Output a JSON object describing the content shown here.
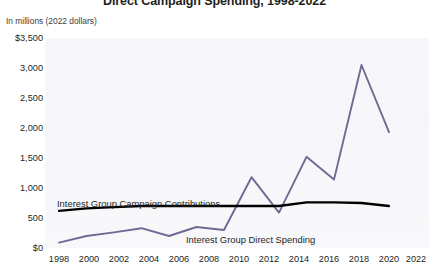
{
  "chart": {
    "title": "Direct Campaign Spending, 1998-2022",
    "axis_units_note": "In millions (2022 dollars)"
  },
  "series_labels": {
    "contributions": "Interest Group Campaign Contributions",
    "direct": "Interest Group Direct Spending"
  },
  "colors": {
    "contributions_line": "#000000",
    "direct_line": "#6b6b94",
    "plot_background": "#f7f7fb",
    "text": "#231f20"
  },
  "chart_data": {
    "type": "line",
    "title": "Direct Campaign Spending, 1998-2022",
    "xlabel": "",
    "ylabel": "In millions (2022 dollars)",
    "x": [
      1998,
      2000,
      2002,
      2004,
      2006,
      2008,
      2010,
      2012,
      2014,
      2016,
      2018,
      2020,
      2022
    ],
    "xtick_labels": [
      "1998",
      "2000",
      "2002",
      "2004",
      "2006",
      "2008",
      "2010",
      "2012",
      "2014",
      "2016",
      "2018",
      "2020",
      "2022"
    ],
    "ytick_labels": [
      "$3,500",
      "3,000",
      "2,500",
      "2,000",
      "1,500",
      "1,000",
      "500",
      "$0"
    ],
    "ytick_values": [
      3500,
      3000,
      2500,
      2000,
      1500,
      1000,
      500,
      0
    ],
    "ylim": [
      0,
      3500
    ],
    "grid": false,
    "legend_position": "inline-annotations",
    "series": [
      {
        "name": "Interest Group Campaign Contributions",
        "color": "#000000",
        "values": [
          620,
          660,
          680,
          700,
          700,
          700,
          700,
          700,
          700,
          760,
          760,
          750,
          700
        ]
      },
      {
        "name": "Interest Group Direct Spending",
        "color": "#6b6b94",
        "values": [
          90,
          200,
          260,
          330,
          200,
          350,
          300,
          1180,
          590,
          1520,
          1140,
          3050,
          1930
        ]
      }
    ]
  }
}
